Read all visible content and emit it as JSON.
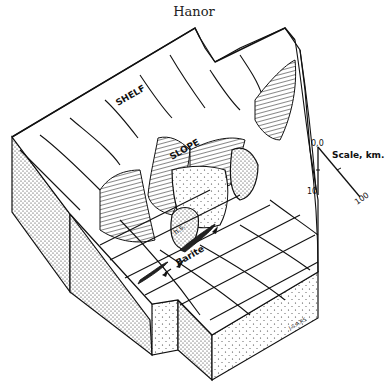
{
  "header": {
    "title": "Hanor"
  },
  "diagram": {
    "labels": {
      "shelf": "SHELF",
      "slope": "SLOPE",
      "hs": "h.s.",
      "barite": "Barite"
    },
    "scale": {
      "title": "Scale, km.",
      "origin": "0,0",
      "vertical_tick": "10",
      "horizontal_tick": "100"
    },
    "signature": "J.S.A.RS"
  }
}
